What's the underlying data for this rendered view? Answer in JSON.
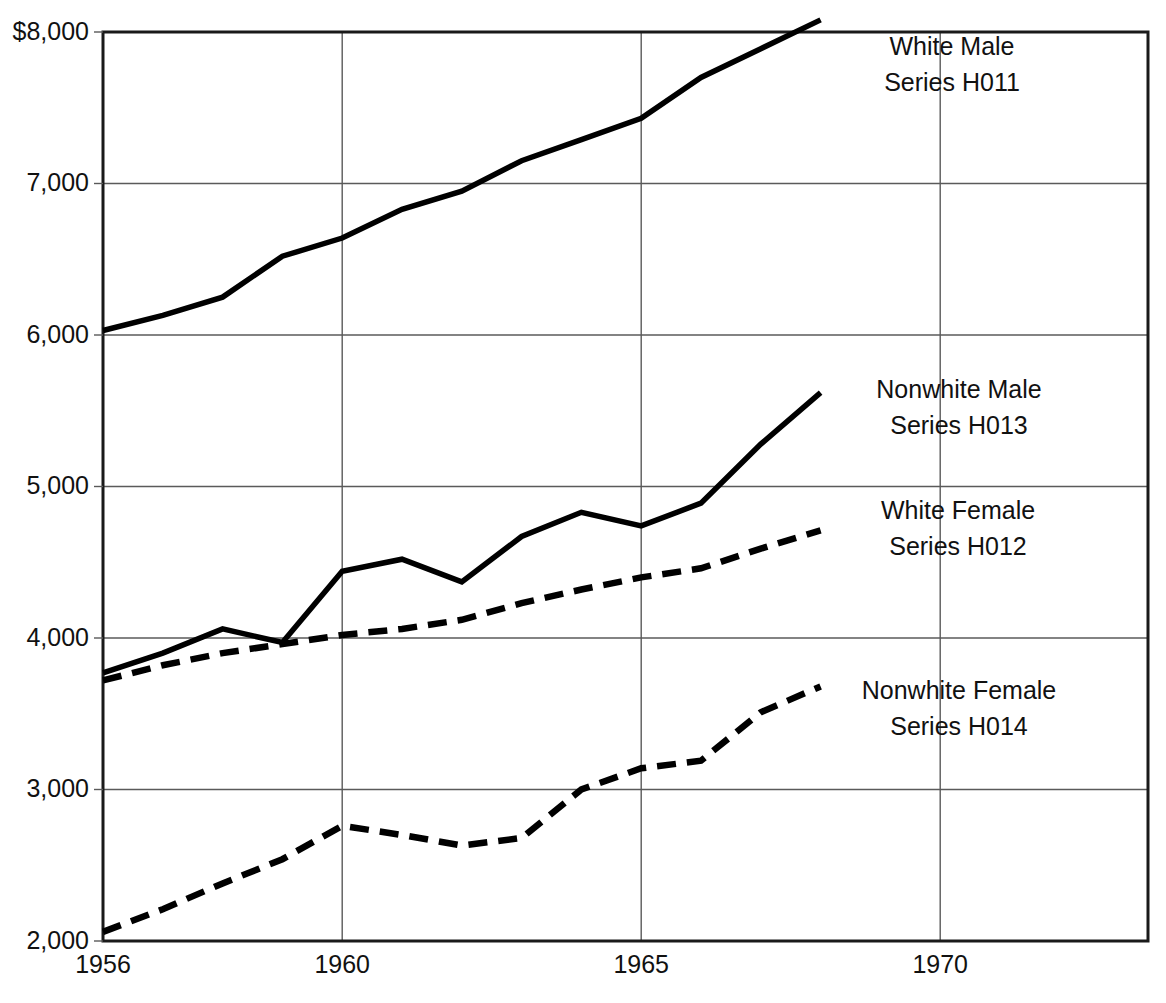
{
  "chart_data": {
    "type": "line",
    "title": "",
    "subtitle": "",
    "xlabel": "",
    "ylabel": "",
    "grid": true,
    "legend_position": "inline-right",
    "xlim": [
      1956,
      1970
    ],
    "ylim": [
      2000,
      8000
    ],
    "x_tick_labels": [
      "1956",
      "1960",
      "1965",
      "1970"
    ],
    "x_tick_values": [
      1956,
      1960,
      1965,
      1970
    ],
    "y_tick_labels": [
      "$8,000",
      "7,000",
      "6,000",
      "5,000",
      "4,000",
      "3,000",
      "2,000"
    ],
    "y_tick_values": [
      8000,
      7000,
      6000,
      5000,
      4000,
      3000,
      2000
    ],
    "x": [
      1956,
      1957,
      1958,
      1959,
      1960,
      1961,
      1962,
      1963,
      1964,
      1965,
      1966,
      1967,
      1968
    ],
    "series": [
      {
        "name": "White Male",
        "code": "Series H011",
        "label_line1": "White Male",
        "label_line2": "Series H011",
        "style": "solid",
        "values": [
          6030,
          6130,
          6250,
          6520,
          6640,
          6830,
          6950,
          7150,
          7290,
          7430,
          7700,
          7890,
          8080
        ]
      },
      {
        "name": "Nonwhite Male",
        "code": "Series H013",
        "label_line1": "Nonwhite Male",
        "label_line2": "Series H013",
        "style": "solid",
        "values": [
          3770,
          3900,
          4060,
          3970,
          4440,
          4520,
          4370,
          4670,
          4830,
          4740,
          4890,
          5280,
          5620
        ]
      },
      {
        "name": "White Female",
        "code": "Series H012",
        "label_line1": "White Female",
        "label_line2": "Series H012",
        "style": "dashed",
        "values": [
          3720,
          3820,
          3900,
          3960,
          4020,
          4060,
          4120,
          4230,
          4320,
          4400,
          4460,
          4590,
          4710
        ]
      },
      {
        "name": "Nonwhite Female",
        "code": "Series H014",
        "label_line1": "Nonwhite Female",
        "label_line2": "Series H014",
        "style": "dashed",
        "values": [
          2060,
          2210,
          2380,
          2540,
          2760,
          2700,
          2630,
          2680,
          3000,
          3140,
          3190,
          3510,
          3680
        ]
      }
    ],
    "colors": {
      "line": "#000000",
      "grid": "#5a5a5a",
      "frame": "#1a1a1a",
      "background": "#ffffff",
      "text": "#111111"
    }
  },
  "annotations": {
    "white_male": {
      "line1": "White Male",
      "line2": "Series H011"
    },
    "nonwhite_male": {
      "line1": "Nonwhite Male",
      "line2": "Series H013"
    },
    "white_female": {
      "line1": "White Female",
      "line2": "Series H012"
    },
    "nonwhite_female": {
      "line1": "Nonwhite Female",
      "line2": "Series H014"
    }
  },
  "axis": {
    "y_labels": [
      "$8,000",
      "7,000",
      "6,000",
      "5,000",
      "4,000",
      "3,000",
      "2,000"
    ],
    "x_labels": [
      "1956",
      "1960",
      "1965",
      "1970"
    ]
  }
}
